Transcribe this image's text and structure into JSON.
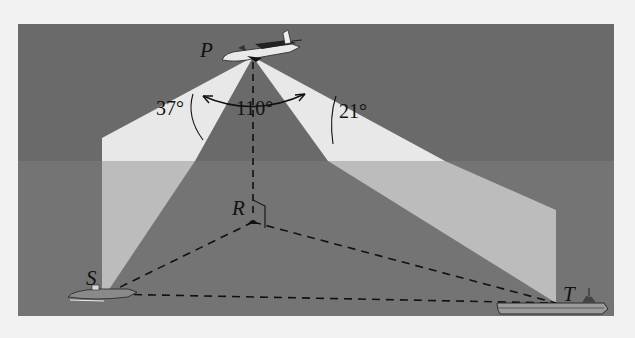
{
  "figure": {
    "points": {
      "P": {
        "label": "P",
        "x": 253,
        "y": 57
      },
      "R": {
        "label": "R",
        "x": 253,
        "y": 222
      },
      "S": {
        "label": "S",
        "x": 106,
        "y": 294
      },
      "T": {
        "label": "T",
        "x": 556,
        "y": 303
      }
    },
    "angles": {
      "left": "37°",
      "center": "110°",
      "right": "21°"
    },
    "colors": {
      "page": "#f2f2f2",
      "sky": "#6a6a6a",
      "sea": "#737373",
      "beam_sky": "#e6e6e6",
      "beam_sea": "#bdbdbd",
      "ink": "#111111"
    }
  }
}
